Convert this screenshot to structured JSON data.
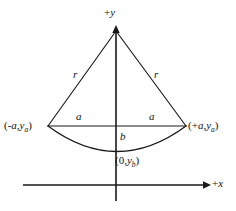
{
  "figure": {
    "background_color": "#ffffff",
    "stroke_color": "#1a1a1a",
    "axes": {
      "y_axis_label": "+y",
      "y_axis_label_sign": "+",
      "y_axis_label_var": "y",
      "x_axis_label": "+x",
      "x_axis_label_sign": "+",
      "x_axis_label_var": "x"
    },
    "segment_labels": {
      "radius_left": "r",
      "radius_right": "r",
      "half_chord_left": "a",
      "half_chord_right": "a",
      "sagitta": "b"
    },
    "point_labels": {
      "left_vertex": {
        "full": "(-a,ya)",
        "open": "(",
        "sign": "-",
        "var1": "a",
        "comma": ",",
        "var2": "y",
        "sub2": "a",
        "close": ")"
      },
      "right_vertex": {
        "full": "(+a,ya)",
        "open": "(",
        "sign": "+",
        "var1": "a",
        "comma": ",",
        "var2": "y",
        "sub2": "a",
        "close": ")"
      },
      "arc_bottom": {
        "full": "(0,yb)",
        "open": "(",
        "zero": "0",
        "comma": ",",
        "var2": "y",
        "sub2": "b",
        "close": ")"
      }
    },
    "geometry": {
      "apex": [
        116,
        30
      ],
      "left_vertex": [
        48,
        126
      ],
      "right_vertex": [
        186,
        126
      ],
      "arc_bottom": [
        116,
        151
      ],
      "y_axis_top": [
        116,
        26
      ],
      "y_axis_bottom": [
        116,
        201
      ],
      "x_axis_left": [
        23,
        185
      ],
      "x_axis_right": [
        208,
        185
      ]
    }
  }
}
